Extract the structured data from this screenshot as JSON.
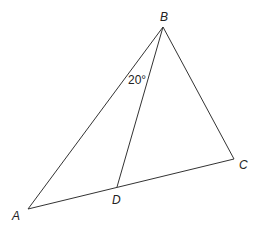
{
  "diagram": {
    "type": "triangle-with-cevian",
    "points": {
      "A": {
        "label": "A",
        "x": 28,
        "y": 209
      },
      "B": {
        "label": "B",
        "x": 163,
        "y": 27
      },
      "C": {
        "label": "C",
        "x": 234,
        "y": 159
      },
      "D": {
        "label": "D",
        "x": 117,
        "y": 187
      }
    },
    "segments": [
      "AB",
      "BC",
      "AC",
      "BD"
    ],
    "angle_label": "20°",
    "angle_at": "ABD"
  }
}
